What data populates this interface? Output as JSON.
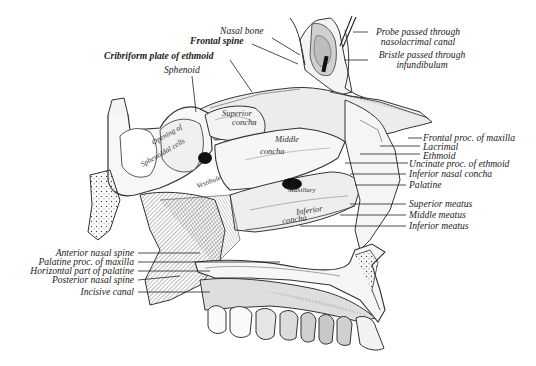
{
  "figure": {
    "background": "#ffffff",
    "ink_color": "#222222"
  },
  "labels_top": {
    "nasal_bone": "Nasal bone",
    "frontal_spine": "Frontal spine",
    "cribriform_plate": "Cribriform plate of ethmoid",
    "sphenoid": "Sphenoid"
  },
  "labels_top_right": {
    "probe_line1": "Probe passed through",
    "probe_line2": "nasolacrimal canal",
    "bristle_line1": "Bristle passed through",
    "bristle_line2": "infundibulum"
  },
  "labels_right": [
    "Frontal proc. of maxilla",
    "Lacrimal",
    "Ethmoid",
    "Uncinate proc. of ethmoid",
    "Inferior nasal concha",
    "Palatine",
    "Superior meatus",
    "Middle meatus",
    "Inferior meatus"
  ],
  "labels_left": [
    "Anterior nasal spine",
    "Palatine proc. of maxilla",
    "Horizontal part of palatine",
    "Posterior nasal spine",
    "Incisive canal"
  ],
  "labels_inner": {
    "superior_concha_1": "Superior",
    "superior_concha_2": "concha",
    "middle_concha_1": "Middle",
    "middle_concha_2": "concha",
    "inferior_concha_1": "Inferior",
    "inferior_concha_2": "concha",
    "sphenoidal_cells_1": "Opening of",
    "sphenoidal_cells_2": "Sphenoidal cells",
    "maxillary": "Maxillary",
    "vestibule": "Vestibule"
  }
}
